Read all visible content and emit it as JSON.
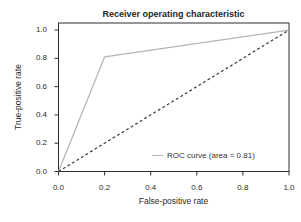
{
  "chart_data": {
    "type": "line",
    "title": "Receiver operating characteristic",
    "xlabel": "False-positive rate",
    "ylabel": "True-positive rate",
    "xlim": [
      0.0,
      1.0
    ],
    "ylim": [
      0.0,
      1.05
    ],
    "xticks": [
      0.0,
      0.2,
      0.4,
      0.6,
      0.8,
      1.0
    ],
    "yticks": [
      0.0,
      0.2,
      0.4,
      0.6,
      0.8,
      1.0
    ],
    "xtick_labels": [
      "0.0",
      "0.2",
      "0.4",
      "0.6",
      "0.8",
      "1.0"
    ],
    "ytick_labels": [
      "0.0",
      "0.2",
      "0.4",
      "0.6",
      "0.8",
      "1.0"
    ],
    "grid": false,
    "area_under_curve": 0.81,
    "legend": {
      "position": "lower right",
      "frame": false
    },
    "series": [
      {
        "name": "ROC curve (area = 0.81)",
        "id": "roc-curve",
        "style": "solid",
        "color": "#b4b4b4",
        "x": [
          0.0,
          0.2,
          1.0
        ],
        "y": [
          0.0,
          0.81,
          1.0
        ],
        "in_legend": true
      },
      {
        "name": "chance diagonal",
        "id": "chance-diagonal",
        "style": "dashed",
        "color": "#383838",
        "x": [
          0.0,
          1.0
        ],
        "y": [
          0.0,
          1.0
        ],
        "in_legend": false
      }
    ]
  },
  "colors": {
    "background": "#ffffff",
    "frame": "#2e2e2e",
    "text": "#2b2b2b",
    "roc_curve": "#b4b4b4",
    "diagonal": "#383838"
  }
}
